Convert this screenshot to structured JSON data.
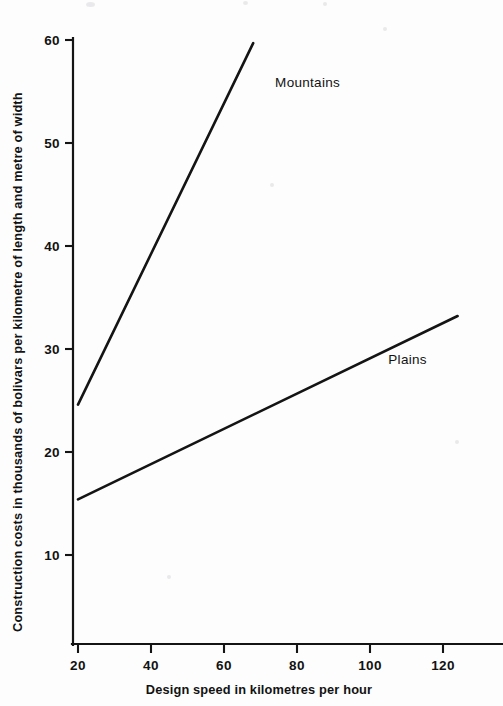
{
  "chart_data": {
    "type": "line",
    "title": "",
    "subtitle": "",
    "xlabel": "Design speed in kilometres per hour",
    "ylabel": "Construction costs in thousands of bolivars per kilometre of length and metre of width",
    "xlim": [
      14,
      133
    ],
    "ylim": [
      0,
      60
    ],
    "xticks": [
      20,
      40,
      60,
      80,
      100,
      120
    ],
    "yticks": [
      10,
      20,
      30,
      40,
      50,
      60
    ],
    "xtick_labels": [
      "20",
      "40",
      "60",
      "80",
      "100",
      "120"
    ],
    "ytick_labels": [
      "10",
      "20",
      "30",
      "40",
      "50",
      "60"
    ],
    "grid": false,
    "legend": "inline-annotations",
    "series": [
      {
        "name": "Mountains",
        "label": "Mountains",
        "color": "#141414",
        "x": [
          20,
          68
        ],
        "y": [
          24.6,
          59.7
        ],
        "points": [
          [
            20,
            24.6
          ],
          [
            68,
            59.7
          ]
        ],
        "label_position": [
          74,
          55.4
        ]
      },
      {
        "name": "Plains",
        "label": "Plains",
        "color": "#141414",
        "x": [
          20,
          124
        ],
        "y": [
          15.4,
          33.2
        ],
        "points": [
          [
            20,
            15.4
          ],
          [
            124,
            33.2
          ]
        ],
        "label_position": [
          105,
          28.5
        ]
      }
    ]
  },
  "axes": {
    "y_title": "Construction costs in thousands of bolivars per kilometre of length and metre of width",
    "x_title": "Design speed in kilometres per hour"
  },
  "colors": {
    "ink": "#141414",
    "paper": "#fdfdfd"
  }
}
